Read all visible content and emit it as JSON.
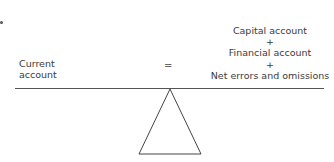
{
  "diagram": {
    "left": {
      "line1": "Current",
      "line2": "account"
    },
    "operator": "=",
    "right": {
      "line1": "Capital account",
      "plus1": "+",
      "line2": "Financial account",
      "plus2": "+",
      "line3": "Net errors and omissions"
    },
    "colors": {
      "line": "#555555",
      "text": "#3a3a3a"
    }
  }
}
